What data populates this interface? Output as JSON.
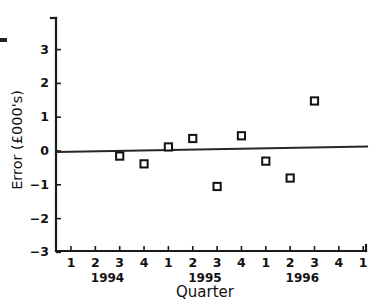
{
  "chart_data": {
    "type": "scatter",
    "title": "",
    "xlabel": "Quarter",
    "ylabel": "Error (£000's)",
    "ylim": [
      -3,
      3.6
    ],
    "ytick_values": [
      3,
      2,
      1,
      0,
      -1,
      -2,
      -3
    ],
    "ytick_labels": [
      "3",
      "2",
      "1",
      "0",
      "−1",
      "−2",
      "−3"
    ],
    "grid": false,
    "legend": "none",
    "x_tick_labels": [
      "1",
      "2",
      "3",
      "4",
      "1",
      "2",
      "3",
      "4",
      "1",
      "2",
      "3",
      "4",
      "1"
    ],
    "x_group_labels": [
      "1994",
      "1995",
      "1996"
    ],
    "x_index_range": [
      1,
      13
    ],
    "series": [
      {
        "name": "Error",
        "marker": "open-square",
        "points": [
          {
            "x": 3,
            "y": -0.15,
            "period": "1994 Q3"
          },
          {
            "x": 4,
            "y": -0.38,
            "period": "1994 Q4"
          },
          {
            "x": 5,
            "y": 0.12,
            "period": "1995 Q1"
          },
          {
            "x": 6,
            "y": 0.37,
            "period": "1995 Q2"
          },
          {
            "x": 7,
            "y": -1.05,
            "period": "1995 Q3"
          },
          {
            "x": 8,
            "y": 0.45,
            "period": "1995 Q4"
          },
          {
            "x": 9,
            "y": -0.3,
            "period": "1996 Q1"
          },
          {
            "x": 10,
            "y": -0.8,
            "period": "1996 Q2"
          },
          {
            "x": 11,
            "y": 1.48,
            "period": "1996 Q3"
          }
        ]
      }
    ],
    "trend_line": {
      "name": "zero-reference-trend",
      "x_start": 0.4,
      "y_start": -0.03,
      "x_end": 13.2,
      "y_end": 0.13
    },
    "colors": {
      "axis": "#1a1a1a",
      "marker_stroke": "#111111",
      "marker_fill": "#ffffff",
      "trend": "#262626",
      "background": "#ffffff"
    }
  }
}
